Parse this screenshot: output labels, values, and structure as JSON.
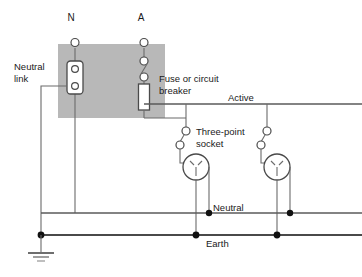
{
  "diagram": {
    "colors": {
      "panel_fill": "#b8b8b8",
      "wire": "#6b6b6b",
      "component": "#4a4a4a",
      "junction": "#111111",
      "background": "#ffffff",
      "text": "#1a1a1a"
    },
    "terminals": [
      {
        "id": "neutral-terminal",
        "label": "N",
        "x": 75,
        "y": 38
      },
      {
        "id": "active-terminal",
        "label": "A",
        "x": 144,
        "y": 38
      }
    ],
    "labels": {
      "neutral_link": "Neutral\nlink",
      "neutral_link_line1": "Neutral",
      "neutral_link_line2": "link",
      "fuse_line1": "Fuse or circuit",
      "fuse_line2": "breaker",
      "socket_line1": "Three-point",
      "socket_line2": "socket",
      "active_bus": "Active",
      "neutral_bus": "Neutral",
      "earth_bus": "Earth"
    },
    "components": [
      {
        "name": "neutral-link",
        "type": "link-bar",
        "terminals": 2
      },
      {
        "name": "circuit-switch",
        "type": "switch",
        "terminals": 2
      },
      {
        "name": "fuse",
        "type": "fuse-body"
      },
      {
        "name": "socket-1",
        "type": "three-point-socket"
      },
      {
        "name": "socket-2",
        "type": "three-point-socket"
      },
      {
        "name": "earth-ground",
        "type": "ground-symbol"
      }
    ],
    "buses": [
      {
        "name": "active",
        "label": "Active",
        "y": 104
      },
      {
        "name": "neutral",
        "label": "Neutral",
        "y": 213
      },
      {
        "name": "earth",
        "label": "Earth",
        "y": 235
      }
    ]
  }
}
